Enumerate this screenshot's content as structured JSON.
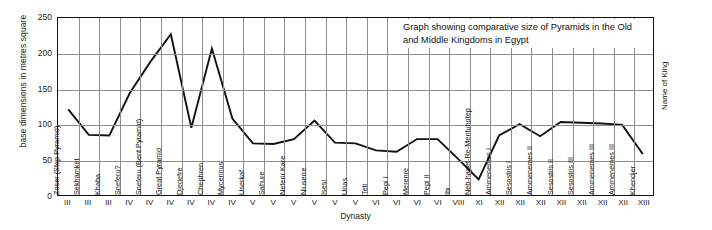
{
  "chart_data": {
    "type": "line",
    "title": "Graph showing comparative size of Pyramids in the Old and Middle Kingdoms in Egypt",
    "title_line1": "Graph showing comparative size of Pyramids in the Old",
    "title_line2": "and Middle Kingdoms in Egypt",
    "ylabel": "base dimensions in metres square",
    "xlabel": "Dynasty",
    "series_label": "Name of King",
    "ylim": [
      0,
      250
    ],
    "yticks": [
      0,
      50,
      100,
      150,
      200,
      250
    ],
    "grid": true,
    "legend": "none",
    "categories": [
      "Zoser (Step Pyramid)",
      "Sekhamket",
      "Khaba",
      "Sneferu?",
      "Sneferu (Bent Pyramid)",
      "Great Pyramid",
      "Djedefre",
      "Chephren",
      "Mycerinus",
      "Userkaf",
      "Sahure",
      "Neferir Kare",
      "Niuserre",
      "Isesi",
      "Unas",
      "Teti",
      "Pepi I",
      "Merenre",
      "Pepi II",
      "Ibi",
      "Neb-hapet-Re-Mentuhotep",
      "Ammenemes I",
      "Sesostris I",
      "Ammenemes II",
      "Sesostris II",
      "Sesostris III",
      "Ammenemes III",
      "Ammenemes III",
      "Khendjer"
    ],
    "dynasties": [
      "III",
      "III",
      "III",
      "IV",
      "IV",
      "IV",
      "IV",
      "IV",
      "IV",
      "V",
      "V",
      "V",
      "V",
      "V",
      "V",
      "VI",
      "VI",
      "VI",
      "VI",
      "VIII",
      "XI",
      "XII",
      "XII",
      "XII",
      "XII",
      "XII",
      "XII",
      "XII",
      "XIII"
    ],
    "values": [
      121,
      85,
      84,
      144,
      188,
      227,
      95,
      207,
      108,
      73,
      72,
      79,
      105,
      74,
      73,
      63,
      61,
      79,
      79,
      51,
      22,
      84,
      100,
      83,
      103,
      102,
      101,
      99,
      58
    ],
    "colors": {
      "line": "#111111",
      "grid": "#8d8d8d",
      "axis": "#111111",
      "background": "#ffffff"
    }
  }
}
